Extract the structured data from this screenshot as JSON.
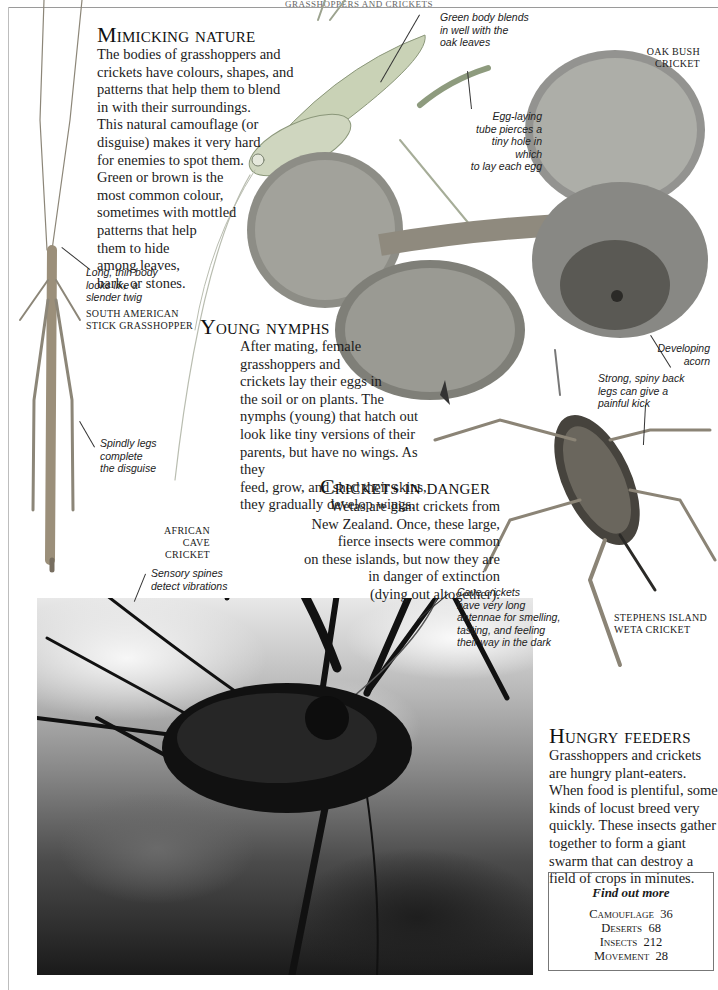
{
  "page": {
    "running_head": "GRASSHOPPERS AND CRICKETS"
  },
  "sections": {
    "mimicking": {
      "title": "Mimicking nature",
      "lines": [
        "The bodies of grasshoppers and",
        "crickets have colours, shapes, and",
        "patterns that help them to blend",
        "in with their surroundings.",
        "This natural camouflage (or",
        "disguise) makes it very hard",
        "for enemies to spot them.",
        "Green or brown is the",
        "most common colour,",
        "sometimes with mottled",
        "patterns that help",
        "them to hide",
        "among leaves,",
        "bark, or stones."
      ]
    },
    "nymphs": {
      "title": "Young nymphs",
      "lines": [
        "After mating, female",
        "grasshoppers and",
        "crickets lay their eggs in",
        "the soil or on plants. The",
        "nymphs (young) that hatch out",
        "look like tiny versions of their",
        "parents, but have no wings. As they",
        "feed, grow, and shed their skins,",
        "they gradually develop wings."
      ]
    },
    "danger": {
      "title": "Crickets in danger",
      "lines": [
        "Wetas are giant crickets from",
        "New Zealand. Once, these large,",
        "fierce insects were common",
        "on these islands, but now they are",
        "in danger of extinction",
        "(dying out altogether)."
      ]
    },
    "feeders": {
      "title": "Hungry feeders",
      "lines": [
        "Grasshoppers and crickets",
        "are hungry plant-eaters.",
        "When food is plentiful, some",
        "kinds of locust breed very",
        "quickly. These insects gather",
        "together to form a giant",
        "swarm that can destroy a",
        "field of crops in minutes."
      ]
    }
  },
  "captions": {
    "green_body": [
      "Green body blends",
      "in well with the",
      "oak leaves"
    ],
    "egg_tube": [
      "Egg-laying",
      "tube pierces a",
      "tiny hole in which",
      "to lay each egg"
    ],
    "long_body": [
      "Long, thin body",
      "looks like a",
      "slender twig"
    ],
    "spindly_legs": [
      "Spindly legs",
      "complete",
      "the disguise"
    ],
    "developing_acorn": [
      "Developing",
      "acorn"
    ],
    "spiny_legs": [
      "Strong, spiny back",
      "legs can give a",
      "painful kick"
    ],
    "sensory_spines": [
      "Sensory spines",
      "detect vibrations"
    ],
    "antennae": [
      "Cave crickets",
      "have very long",
      "antennae for smelling,",
      "tasting, and feeling",
      "their way in the dark"
    ]
  },
  "labels": {
    "oak_bush": [
      "OAK BUSH",
      "CRICKET"
    ],
    "stick_grasshopper": [
      "SOUTH AMERICAN",
      "STICK GRASSHOPPER"
    ],
    "cave_cricket": [
      "AFRICAN",
      "CAVE CRICKET"
    ],
    "weta": [
      "STEPHENS ISLAND",
      "WETA CRICKET"
    ]
  },
  "find_out_more": {
    "heading": "Find out more",
    "items": [
      {
        "topic": "Camouflage",
        "page": "36"
      },
      {
        "topic": "Deserts",
        "page": "68"
      },
      {
        "topic": "Insects",
        "page": "212"
      },
      {
        "topic": "Movement",
        "page": "28"
      }
    ]
  },
  "colors": {
    "text": "#1a1a1a",
    "rule": "#9a9a9a",
    "box_border": "#777777"
  }
}
